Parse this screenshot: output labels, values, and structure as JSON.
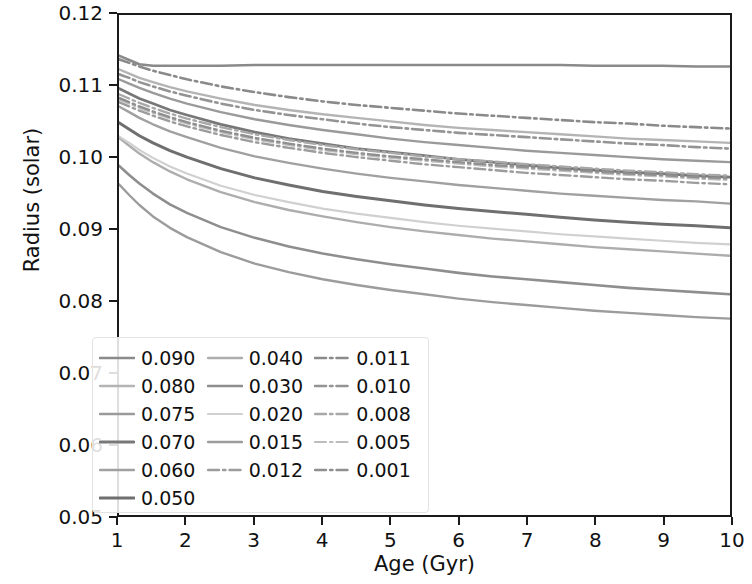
{
  "chart_data": {
    "type": "line",
    "title": "",
    "xlabel": "Age (Gyr)",
    "ylabel": "Radius (solar)",
    "xlim": [
      1,
      10
    ],
    "ylim": [
      0.05,
      0.12
    ],
    "xticks": [
      "1",
      "2",
      "3",
      "4",
      "5",
      "6",
      "7",
      "8",
      "9",
      "10"
    ],
    "xtick_values": [
      1,
      2,
      3,
      4,
      5,
      6,
      7,
      8,
      9,
      10
    ],
    "yticks": [
      "0.05",
      "0.06",
      "0.07",
      "0.08",
      "0.09",
      "0.10",
      "0.11",
      "0.12"
    ],
    "ytick_values": [
      0.05,
      0.06,
      0.07,
      0.08,
      0.09,
      0.1,
      0.11,
      0.12
    ],
    "grid": false,
    "legend_position": "lower left",
    "legend_title": "",
    "legend_ncols": 3,
    "x": [
      1.0,
      1.15,
      1.3,
      1.5,
      1.75,
      2.0,
      2.5,
      3.0,
      3.5,
      4.0,
      4.5,
      5.0,
      5.5,
      6.0,
      6.5,
      7.0,
      7.5,
      8.0,
      8.5,
      9.0,
      9.5,
      10.0
    ],
    "series": [
      {
        "name": "0.090",
        "color": "#8a8a8a",
        "dash": "solid",
        "width": 2.6,
        "values": [
          0.1143,
          0.1137,
          0.1131,
          0.1129,
          0.1129,
          0.1129,
          0.1129,
          0.113,
          0.113,
          0.113,
          0.113,
          0.113,
          0.113,
          0.113,
          0.113,
          0.113,
          0.113,
          0.1129,
          0.1129,
          0.1129,
          0.1128,
          0.1128
        ]
      },
      {
        "name": "0.080",
        "color": "#b4b4b4",
        "dash": "solid",
        "width": 2.4,
        "values": [
          0.1124,
          0.1118,
          0.1112,
          0.1106,
          0.1099,
          0.1093,
          0.1083,
          0.1074,
          0.1067,
          0.1061,
          0.1056,
          0.1051,
          0.1046,
          0.1042,
          0.1039,
          0.1036,
          0.1033,
          0.103,
          0.1027,
          0.1025,
          0.1023,
          0.1021
        ]
      },
      {
        "name": "0.075",
        "color": "#9a9a9a",
        "dash": "solid",
        "width": 2.4,
        "values": [
          0.111,
          0.1104,
          0.1098,
          0.1091,
          0.1083,
          0.1076,
          0.1064,
          0.1054,
          0.1046,
          0.1039,
          0.1033,
          0.1027,
          0.1022,
          0.1018,
          0.1014,
          0.101,
          0.1007,
          0.1004,
          0.1001,
          0.0998,
          0.0996,
          0.0994
        ]
      },
      {
        "name": "0.070",
        "color": "#787878",
        "dash": "solid",
        "width": 2.8,
        "values": [
          0.1097,
          0.109,
          0.1083,
          0.1076,
          0.1067,
          0.106,
          0.1047,
          0.1036,
          0.1027,
          0.102,
          0.1013,
          0.1008,
          0.1003,
          0.0998,
          0.0994,
          0.099,
          0.0986,
          0.0983,
          0.098,
          0.0978,
          0.0975,
          0.0973
        ]
      },
      {
        "name": "0.060",
        "color": "#a0a0a0",
        "dash": "solid",
        "width": 2.4,
        "values": [
          0.1072,
          0.1064,
          0.1056,
          0.1047,
          0.1037,
          0.1029,
          0.1014,
          0.1002,
          0.0993,
          0.0985,
          0.0978,
          0.0972,
          0.0967,
          0.0962,
          0.0958,
          0.0954,
          0.095,
          0.0947,
          0.0944,
          0.0941,
          0.0939,
          0.0936
        ]
      },
      {
        "name": "0.050",
        "color": "#6f6f6f",
        "dash": "solid",
        "width": 3.0,
        "values": [
          0.1049,
          0.104,
          0.1031,
          0.1021,
          0.101,
          0.1001,
          0.0985,
          0.0972,
          0.0962,
          0.0953,
          0.0946,
          0.094,
          0.0934,
          0.0929,
          0.0925,
          0.0921,
          0.0917,
          0.0913,
          0.091,
          0.0907,
          0.0905,
          0.0902
        ]
      },
      {
        "name": "0.040",
        "color": "#adadad",
        "dash": "solid",
        "width": 2.4,
        "values": [
          0.1028,
          0.1017,
          0.1006,
          0.0994,
          0.0981,
          0.097,
          0.0952,
          0.0938,
          0.0927,
          0.0918,
          0.091,
          0.0903,
          0.0897,
          0.0892,
          0.0887,
          0.0883,
          0.0879,
          0.0875,
          0.0872,
          0.0869,
          0.0866,
          0.0863
        ]
      },
      {
        "name": "0.030",
        "color": "#8e8e8e",
        "dash": "solid",
        "width": 2.6,
        "values": [
          0.0989,
          0.0976,
          0.0964,
          0.095,
          0.0935,
          0.0923,
          0.0903,
          0.0888,
          0.0876,
          0.0866,
          0.0858,
          0.0851,
          0.0845,
          0.0839,
          0.0834,
          0.083,
          0.0826,
          0.0822,
          0.0818,
          0.0815,
          0.0812,
          0.0809
        ]
      },
      {
        "name": "0.020",
        "color": "#d0d0d0",
        "dash": "solid",
        "width": 2.2,
        "values": [
          0.103,
          0.1021,
          0.1011,
          0.1,
          0.0988,
          0.0978,
          0.0961,
          0.0948,
          0.0938,
          0.0929,
          0.0922,
          0.0916,
          0.091,
          0.0905,
          0.0901,
          0.0897,
          0.0893,
          0.089,
          0.0887,
          0.0884,
          0.0881,
          0.0879
        ]
      },
      {
        "name": "0.015",
        "color": "#9c9c9c",
        "dash": "solid",
        "width": 2.4,
        "values": [
          0.0963,
          0.0948,
          0.0934,
          0.0918,
          0.0902,
          0.0889,
          0.0868,
          0.0852,
          0.084,
          0.083,
          0.0822,
          0.0815,
          0.0809,
          0.0803,
          0.0798,
          0.0794,
          0.079,
          0.0786,
          0.0783,
          0.078,
          0.0777,
          0.0775
        ]
      },
      {
        "name": "0.012",
        "color": "#9c9c9c",
        "dash": "dashdot",
        "width": 2.4,
        "values": [
          0.1078,
          0.1072,
          0.1066,
          0.1059,
          0.1051,
          0.1044,
          0.1032,
          0.1022,
          0.1014,
          0.1007,
          0.1001,
          0.0996,
          0.0991,
          0.0987,
          0.0983,
          0.0979,
          0.0976,
          0.0973,
          0.097,
          0.0968,
          0.0965,
          0.0963
        ]
      },
      {
        "name": "0.011",
        "color": "#8a8a8a",
        "dash": "dashdot",
        "width": 2.6,
        "values": [
          0.1138,
          0.1133,
          0.1128,
          0.1122,
          0.1116,
          0.111,
          0.11,
          0.1092,
          0.1085,
          0.1079,
          0.1074,
          0.107,
          0.1066,
          0.1062,
          0.1059,
          0.1056,
          0.1053,
          0.105,
          0.1048,
          0.1045,
          0.1043,
          0.1041
        ]
      },
      {
        "name": "0.010",
        "color": "#949494",
        "dash": "dashdot",
        "width": 2.6,
        "values": [
          0.1117,
          0.1112,
          0.1106,
          0.11,
          0.1093,
          0.1087,
          0.1076,
          0.1067,
          0.106,
          0.1054,
          0.1048,
          0.1043,
          0.1039,
          0.1035,
          0.1032,
          0.1029,
          0.1026,
          0.1023,
          0.102,
          0.1018,
          0.1015,
          0.1013
        ]
      },
      {
        "name": "0.008",
        "color": "#a8a8a8",
        "dash": "dashdot",
        "width": 2.4,
        "values": [
          0.1089,
          0.1083,
          0.1077,
          0.107,
          0.1062,
          0.1055,
          0.1043,
          0.1033,
          0.1025,
          0.1018,
          0.1012,
          0.1007,
          0.1002,
          0.0998,
          0.0995,
          0.0991,
          0.0988,
          0.0985,
          0.0982,
          0.098,
          0.0977,
          0.0975
        ]
      },
      {
        "name": "0.005",
        "color": "#bdbdbd",
        "dash": "dashdot",
        "width": 2.2,
        "values": [
          0.1082,
          0.1076,
          0.107,
          0.1063,
          0.1055,
          0.1048,
          0.1036,
          0.1026,
          0.1018,
          0.1011,
          0.1005,
          0.1,
          0.0996,
          0.0992,
          0.0988,
          0.0985,
          0.0982,
          0.0979,
          0.0976,
          0.0974,
          0.0971,
          0.0969
        ]
      },
      {
        "name": "0.001",
        "color": "#8f8f8f",
        "dash": "dashdot",
        "width": 2.4,
        "values": [
          0.1084,
          0.1078,
          0.1072,
          0.1065,
          0.1057,
          0.105,
          0.1038,
          0.1028,
          0.102,
          0.1013,
          0.1007,
          0.1002,
          0.0998,
          0.0994,
          0.099,
          0.0987,
          0.0984,
          0.0981,
          0.0978,
          0.0976,
          0.0973,
          0.0971
        ]
      }
    ],
    "legend_columns": [
      [
        "0.090",
        "0.080",
        "0.075",
        "0.070",
        "0.060",
        "0.050"
      ],
      [
        "0.040",
        "0.030",
        "0.020",
        "0.015",
        "0.012"
      ],
      [
        "0.011",
        "0.010",
        "0.008",
        "0.005",
        "0.001"
      ]
    ]
  }
}
